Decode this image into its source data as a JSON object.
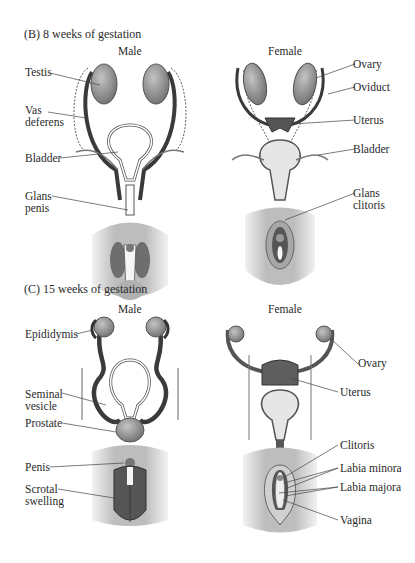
{
  "panels": [
    {
      "title": "(B)  8 weeks of gestation",
      "male_header": "Male",
      "female_header": "Female",
      "male_labels": [
        "Testis",
        "Vas deferens",
        "Bladder",
        "Glans penis"
      ],
      "female_labels": [
        "Ovary",
        "Oviduct",
        "Uterus",
        "Bladder",
        "Glans clitoris"
      ]
    },
    {
      "title": "(C)  15 weeks of gestation",
      "male_header": "Male",
      "female_header": "Female",
      "male_labels": [
        "Epididymis",
        "Seminal vesicle",
        "Prostate",
        "Penis",
        "Scrotal swelling"
      ],
      "female_labels": [
        "Ovary",
        "Uterus",
        "Clitoris",
        "Labia minora",
        "Labia majora",
        "Vagina"
      ]
    }
  ],
  "colors": {
    "organ_gray": "#8a8a8a",
    "duct_dark": "#3a3a3a",
    "skin": "#c9c9c9",
    "bladder_light": "#e6e6e6"
  }
}
